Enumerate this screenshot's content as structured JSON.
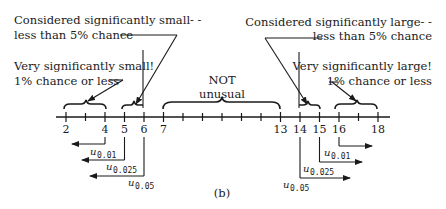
{
  "figure_label": "(b)",
  "annotations": {
    "small_5": {
      "line1": "Considered significantly small- -",
      "line2": "less than 5% chance"
    },
    "small_1": {
      "line1": "Very significantly small!",
      "line2": "1% chance or less"
    },
    "not_unusual": {
      "line1": "NOT",
      "line2": "unusual"
    },
    "large_5": {
      "line1": "Considered significantly large- -",
      "line2": "less than 5% chance"
    },
    "large_1": {
      "line1": "Very significantly large!",
      "line2": "1% chance or less"
    }
  },
  "axis": {
    "ticks": [
      2,
      3,
      4,
      5,
      6,
      7,
      8,
      9,
      10,
      11,
      12,
      13,
      14,
      15,
      16,
      17,
      18
    ],
    "labels": [
      {
        "value": 2,
        "text": "2"
      },
      {
        "value": 4,
        "text": "4"
      },
      {
        "value": 5,
        "text": "5"
      },
      {
        "value": 6,
        "text": "6"
      },
      {
        "value": 7,
        "text": "7"
      },
      {
        "value": 13,
        "text": "13"
      },
      {
        "value": 14,
        "text": "14"
      },
      {
        "value": 15,
        "text": "15"
      },
      {
        "value": 16,
        "text": "16"
      },
      {
        "value": 18,
        "text": "18"
      }
    ]
  },
  "critical_values": {
    "lower": [
      {
        "symbol": "u",
        "sub": "0.01",
        "at": 4
      },
      {
        "symbol": "u",
        "sub": "0.025",
        "at": 5
      },
      {
        "symbol": "u",
        "sub": "0.05",
        "at": 6
      }
    ],
    "upper": [
      {
        "symbol": "u",
        "sub": "0.01",
        "at": 16
      },
      {
        "symbol": "u",
        "sub": "0.025",
        "at": 15
      },
      {
        "symbol": "u",
        "sub": "0.05",
        "at": 14
      }
    ]
  }
}
